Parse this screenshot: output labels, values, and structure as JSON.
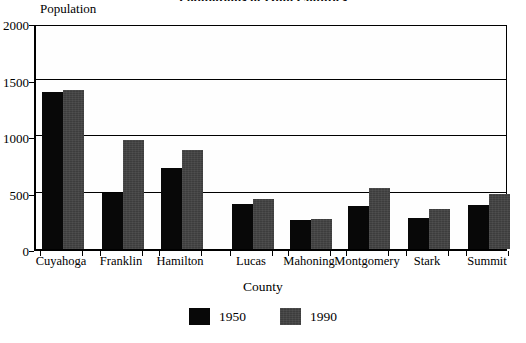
{
  "chart_data": {
    "type": "bar",
    "title": "Populations of Ohio Counties",
    "xlabel": "County",
    "ylabel": "Population",
    "ylim": [
      0,
      2000
    ],
    "yticks": [
      0,
      500,
      1000,
      1500,
      2000
    ],
    "ytick_labels": [
      "0",
      "500",
      "1000",
      "1500",
      "2000"
    ],
    "grid": true,
    "grid_axis": "y",
    "legend_position": "bottom-center",
    "categories": [
      "Cuyahoga",
      "Franklin",
      "Hamilton",
      "Lucas",
      "Mahoning",
      "Montgomery",
      "Stark",
      "Summit"
    ],
    "series": [
      {
        "name": "1950",
        "color": "#080808",
        "values": [
          1390,
          495,
          715,
          395,
          255,
          380,
          275,
          390
        ]
      },
      {
        "name": "1990",
        "color": "#3d3d3d",
        "values": [
          1410,
          965,
          875,
          440,
          265,
          540,
          355,
          485
        ]
      }
    ]
  }
}
